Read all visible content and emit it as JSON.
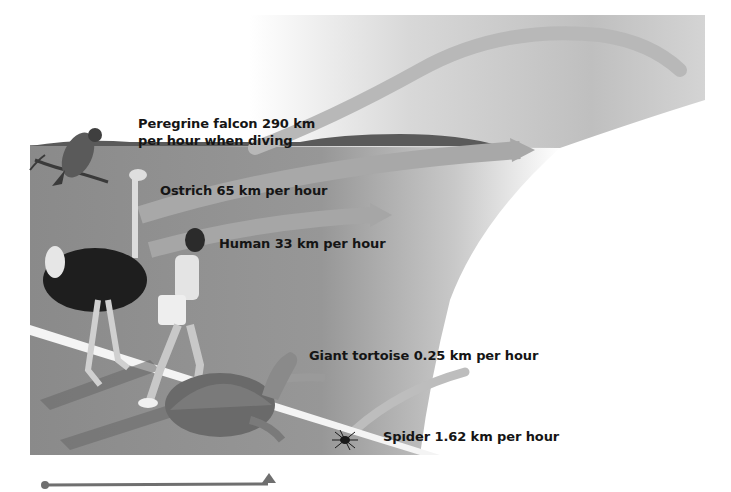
{
  "figure": {
    "labels": {
      "falcon_line1": "Peregrine falcon 290 km",
      "falcon_line2": "per hour when diving",
      "ostrich": "Ostrich 65 km per hour",
      "human": "Human 33 km per hour",
      "tortoise": "Giant tortoise 0.25 km per hour",
      "spider": "Spider 1.62 km per hour"
    },
    "animals": [
      {
        "name": "Peregrine falcon",
        "speed_kmh": 290,
        "note": "when diving"
      },
      {
        "name": "Ostrich",
        "speed_kmh": 65
      },
      {
        "name": "Human",
        "speed_kmh": 33
      },
      {
        "name": "Giant tortoise",
        "speed_kmh": 0.25
      },
      {
        "name": "Spider",
        "speed_kmh": 1.62
      }
    ],
    "colors": {
      "ground": "#8e8e8e",
      "sky": "#c9c9c9",
      "track_line": "#f4f4f4",
      "scale_bar": "#6f6f6f"
    }
  }
}
